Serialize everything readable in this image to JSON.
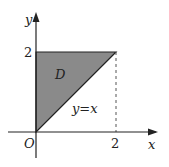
{
  "diagram": {
    "axes": {
      "x_label": "x",
      "y_label": "y",
      "origin_label": "O"
    },
    "ticks": {
      "x_tick": "2",
      "y_tick": "2"
    },
    "region": {
      "label": "D",
      "vertices": [
        [
          0,
          0
        ],
        [
          0,
          2
        ],
        [
          2,
          2
        ]
      ],
      "fill_color": "#8a8a8a"
    },
    "line": {
      "label": "y=x"
    },
    "colors": {
      "stroke": "#222222",
      "fill": "#8a8a8a"
    }
  }
}
